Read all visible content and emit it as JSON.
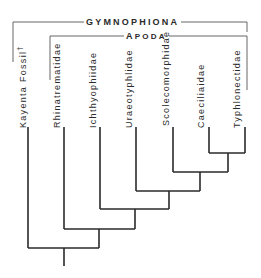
{
  "groups": {
    "gymnophiona": "GYMNOPHIONA",
    "apoda": "APODA",
    "apoda_first_letter": "A",
    "apoda_rest": "PODA"
  },
  "taxa": [
    {
      "name": "Kayenta Fossil",
      "mark": "†"
    },
    {
      "name": "Rhinatrematidae"
    },
    {
      "name": "Ichthyophiidae"
    },
    {
      "name": "Uraeotyphlidae"
    },
    {
      "name": "Scolecomorphidae"
    },
    {
      "name": "Caeciliaidae"
    },
    {
      "name": "Typhlonectidae"
    }
  ],
  "tree": {
    "line_color": "#2a2a2a",
    "tip_x": [
      28,
      64,
      100,
      136,
      173,
      209,
      245
    ],
    "tip_top_y": 127,
    "nodes": [
      {
        "left_x": 209,
        "right_x": 245,
        "y": 153,
        "mid_x": 228
      },
      {
        "left_x": 173,
        "right_x": 228,
        "y": 172,
        "mid_x": 200
      },
      {
        "left_x": 136,
        "right_x": 200,
        "y": 191,
        "mid_x": 169
      },
      {
        "left_x": 100,
        "right_x": 169,
        "y": 209,
        "mid_x": 135
      },
      {
        "left_x": 64,
        "right_x": 135,
        "y": 229,
        "mid_x": 99
      },
      {
        "left_x": 28,
        "right_x": 99,
        "y": 248,
        "mid_x": 64
      }
    ],
    "root_bottom_y": 266
  }
}
